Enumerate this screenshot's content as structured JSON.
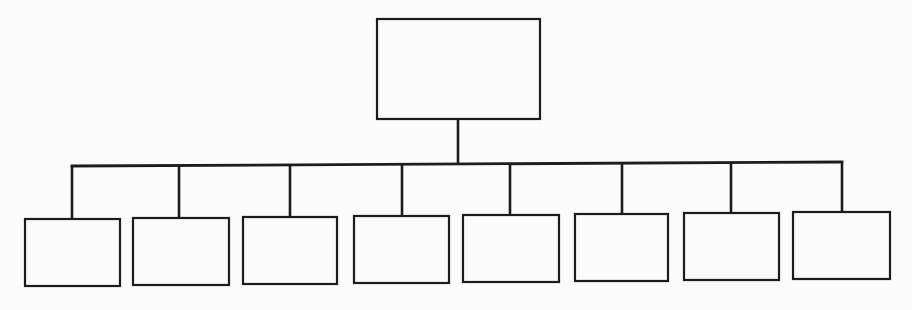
{
  "diagram": {
    "type": "org-chart",
    "line_color": "#1c1c1c",
    "background": "#fbfbfb",
    "root": {
      "label": "",
      "x": 377,
      "y": 19,
      "w": 163,
      "h": 100
    },
    "connector": {
      "root_x": 458,
      "bus_y_left": 166,
      "bus_y_right": 162,
      "bus_x_start": 72,
      "bus_x_end": 842
    },
    "children": [
      {
        "label": "",
        "x": 25,
        "y": 219,
        "w": 95,
        "h": 67,
        "cx": 72
      },
      {
        "label": "",
        "x": 133,
        "y": 218,
        "w": 96,
        "h": 67,
        "cx": 179
      },
      {
        "label": "",
        "x": 243,
        "y": 217,
        "w": 94,
        "h": 67,
        "cx": 290
      },
      {
        "label": "",
        "x": 354,
        "y": 216,
        "w": 95,
        "h": 67,
        "cx": 402
      },
      {
        "label": "",
        "x": 463,
        "y": 215,
        "w": 96,
        "h": 67,
        "cx": 510
      },
      {
        "label": "",
        "x": 575,
        "y": 214,
        "w": 93,
        "h": 67,
        "cx": 622
      },
      {
        "label": "",
        "x": 684,
        "y": 213,
        "w": 95,
        "h": 67,
        "cx": 731
      },
      {
        "label": "",
        "x": 793,
        "y": 212,
        "w": 97,
        "h": 67,
        "cx": 842
      }
    ]
  }
}
